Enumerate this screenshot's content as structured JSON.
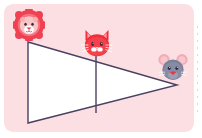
{
  "canvas": {
    "width": 202,
    "height": 138,
    "page_background": "#ffffff"
  },
  "card": {
    "name": "worksheet-card",
    "background": "#fbdfe3",
    "corner_radius": 9,
    "x": 4,
    "y": 4,
    "width": 190,
    "height": 128
  },
  "edge_ruler": {
    "label": "dotted-edge-guide",
    "color": "#cfcfcf"
  },
  "figure": {
    "fill": "#ffffff",
    "stroke": "#4a4060",
    "stroke_width": 1.4,
    "outer_triangle": {
      "label": "large-triangle",
      "vertices": [
        {
          "name": "top-left",
          "x": 28,
          "y": 42
        },
        {
          "name": "bottom-left",
          "x": 28,
          "y": 123
        },
        {
          "name": "right-apex",
          "x": 177,
          "y": 85
        }
      ],
      "points": "28,42 28,123 177,85"
    },
    "divider": {
      "label": "vertical-divider-segment",
      "x1": 96,
      "y1": 52,
      "x2": 96,
      "y2": 113
    }
  },
  "stickers": [
    {
      "id": "lion",
      "icon": "lion-face-icon",
      "label": "Lion",
      "x": 13,
      "y": 9,
      "size": 32,
      "colors": {
        "mane": "#ef4152",
        "mane_inner": "#f5717e",
        "face": "#f9c6c6",
        "muzzle": "#ffffff",
        "nose": "#e03a4e",
        "eye": "#3a2f3f"
      },
      "anchor": "near-top-left-vertex"
    },
    {
      "id": "cat",
      "icon": "cat-face-icon",
      "label": "Cat",
      "x": 81,
      "y": 27,
      "size": 32,
      "colors": {
        "fur": "#f02d3a",
        "fur_shade": "#d81f30",
        "inner_ear": "#f9a0a8",
        "muzzle": "#ffffff",
        "nose": "#ffffff",
        "eye": "#3a2f3f",
        "whisker": "#ffffff"
      },
      "anchor": "above-vertical-divider"
    },
    {
      "id": "mouse",
      "icon": "mouse-face-icon",
      "label": "Mouse",
      "x": 157,
      "y": 52,
      "size": 32,
      "colors": {
        "fur": "#7b8199",
        "fur_shade": "#666c86",
        "ear": "#f2aab5",
        "ear_inner": "#f7c7ce",
        "muzzle": "#9aa0b4",
        "nose": "#e23a4a",
        "bow": "#e23a4a",
        "eye": "#2f2a3a",
        "whisker": "#ffffff"
      },
      "anchor": "near-right-apex"
    }
  ]
}
